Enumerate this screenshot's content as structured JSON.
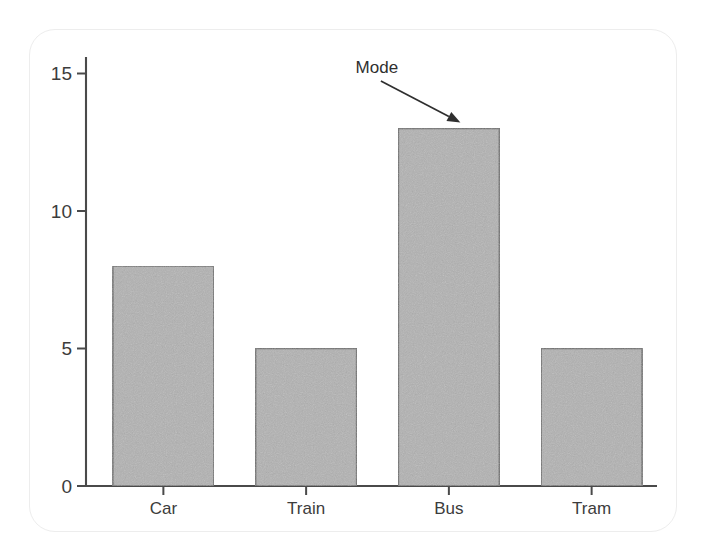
{
  "chart_data": {
    "type": "bar",
    "title": "",
    "subtitle": "",
    "xlabel": "",
    "ylabel": "",
    "categories": [
      "Car",
      "Train",
      "Bus",
      "Tram"
    ],
    "values": [
      8,
      5,
      13,
      5
    ],
    "series": [
      {
        "name": "Count",
        "values": [
          8,
          5,
          13,
          5
        ]
      }
    ],
    "ylim": [
      0,
      15.6
    ],
    "yticks": [
      0,
      5,
      10,
      15
    ],
    "ytick_labels": [
      "0",
      "5",
      "10",
      "15"
    ],
    "grid": false,
    "legend": false,
    "legend_position": "none",
    "annotations": [
      {
        "text": "Mode",
        "target_category": "Bus",
        "target_value": 13,
        "arrow": true,
        "arrow_direction": "down-right"
      }
    ],
    "bar_fill_color": "#b2b2b2",
    "bar_edge_color": "#6e6e6e",
    "axis_color": "#4a4a4a",
    "background_color": "#ffffff"
  },
  "figure": {
    "frame_color": "#ededed"
  }
}
